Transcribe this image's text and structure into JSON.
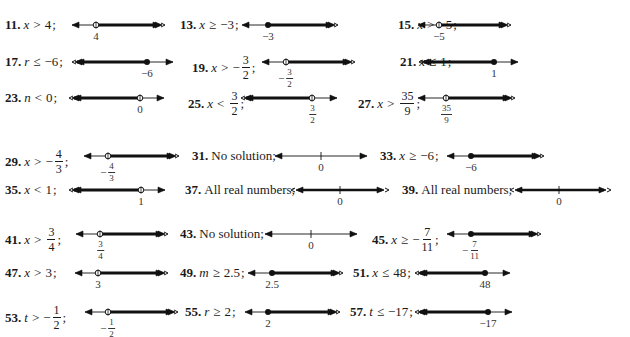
{
  "answers": [
    {
      "id": "11",
      "num": "11.",
      "var": "x",
      "rel": ">",
      "val": "4",
      "kind": "ineq",
      "x": 5,
      "y": 25,
      "line": {
        "x1": 72,
        "x2": 162,
        "point": 96,
        "closed": false,
        "dir": "right",
        "label": "4"
      }
    },
    {
      "id": "13",
      "num": "13.",
      "var": "x",
      "rel": "≥",
      "val": "−3",
      "kind": "ineq",
      "x": 180,
      "y": 25,
      "line": {
        "x1": 242,
        "x2": 335,
        "point": 268,
        "closed": true,
        "dir": "right",
        "label": "−3"
      }
    },
    {
      "id": "15",
      "num": "15.",
      "var": "x",
      "rel": ">",
      "val": "−5",
      "kind": "ineq",
      "x": 398,
      "y": 25,
      "line": {
        "x1": 418,
        "x2": 508,
        "point": 439,
        "closed": false,
        "dir": "right",
        "label": "−5"
      }
    },
    {
      "id": "17",
      "num": "17.",
      "var": "r",
      "rel": "≤",
      "val": "−6",
      "kind": "ineq",
      "x": 5,
      "y": 62,
      "line": {
        "x1": 75,
        "x2": 173,
        "point": 147,
        "closed": true,
        "dir": "left",
        "label": "−6"
      }
    },
    {
      "id": "19",
      "num": "19.",
      "var": "x",
      "rel": ">",
      "val_sign": "−",
      "val_num": "3",
      "val_den": "2",
      "kind": "frac",
      "x": 192,
      "y": 62,
      "line": {
        "x1": 262,
        "x2": 352,
        "point": 286,
        "closed": false,
        "dir": "right",
        "label_sign": "−",
        "label_num": "3",
        "label_den": "2"
      }
    },
    {
      "id": "21",
      "num": "21.",
      "var": "x",
      "rel": "≤",
      "val": "1",
      "kind": "ineq",
      "x": 400,
      "y": 62,
      "line": {
        "x1": 422,
        "x2": 518,
        "point": 494,
        "closed": true,
        "dir": "left",
        "label": "1"
      }
    },
    {
      "id": "23",
      "num": "23.",
      "var": "n",
      "rel": "<",
      "val": "0",
      "kind": "ineq",
      "x": 5,
      "y": 98,
      "line": {
        "x1": 72,
        "x2": 164,
        "point": 140,
        "closed": false,
        "dir": "left",
        "label": "0"
      }
    },
    {
      "id": "25",
      "num": "25.",
      "var": "x",
      "rel": "<",
      "val_sign": "",
      "val_num": "3",
      "val_den": "2",
      "kind": "frac",
      "x": 188,
      "y": 98,
      "line": {
        "x1": 244,
        "x2": 337,
        "point": 312,
        "closed": false,
        "dir": "left",
        "label_sign": "",
        "label_num": "3",
        "label_den": "2"
      }
    },
    {
      "id": "27",
      "num": "27.",
      "var": "x",
      "rel": ">",
      "val_sign": "",
      "val_num": "35",
      "val_den": "9",
      "kind": "frac",
      "x": 358,
      "y": 98,
      "line": {
        "x1": 418,
        "x2": 512,
        "point": 446,
        "closed": false,
        "dir": "right",
        "label_sign": "",
        "label_num": "35",
        "label_den": "9"
      }
    },
    {
      "id": "29",
      "num": "29.",
      "var": "x",
      "rel": ">",
      "val_sign": "−",
      "val_num": "4",
      "val_den": "3",
      "kind": "frac",
      "x": 5,
      "y": 156,
      "line": {
        "x1": 84,
        "x2": 176,
        "point": 108,
        "closed": false,
        "dir": "right",
        "label_sign": "−",
        "label_num": "4",
        "label_den": "3"
      }
    },
    {
      "id": "31",
      "num": "31.",
      "text": "No solution;",
      "kind": "text",
      "x": 192,
      "y": 156,
      "line": {
        "x1": 275,
        "x2": 367,
        "tick": 321,
        "dir": "none",
        "label": "0"
      }
    },
    {
      "id": "33",
      "num": "33.",
      "var": "x",
      "rel": "≥",
      "val": "−6",
      "kind": "ineq",
      "x": 380,
      "y": 156,
      "line": {
        "x1": 447,
        "x2": 541,
        "point": 471,
        "closed": true,
        "dir": "right",
        "label": "−6"
      }
    },
    {
      "id": "35",
      "num": "35.",
      "var": "x",
      "rel": "<",
      "val": "1",
      "kind": "ineq",
      "x": 5,
      "y": 190,
      "line": {
        "x1": 72,
        "x2": 165,
        "point": 141,
        "closed": false,
        "dir": "left",
        "label": "1"
      }
    },
    {
      "id": "37",
      "num": "37.",
      "text": "All real numbers;",
      "kind": "text",
      "x": 185,
      "y": 190,
      "line": {
        "x1": 296,
        "x2": 384,
        "tick": 340,
        "dir": "both",
        "label": "0"
      }
    },
    {
      "id": "39",
      "num": "39.",
      "text": "All real numbers;",
      "kind": "text",
      "x": 402,
      "y": 190,
      "line": {
        "x1": 515,
        "x2": 606,
        "tick": 559,
        "dir": "both",
        "label": "0"
      }
    },
    {
      "id": "41",
      "num": "41.",
      "var": "x",
      "rel": ">",
      "val_sign": "",
      "val_num": "3",
      "val_den": "4",
      "kind": "frac",
      "x": 5,
      "y": 234,
      "line": {
        "x1": 76,
        "x2": 165,
        "point": 100,
        "closed": false,
        "dir": "right",
        "label_sign": "",
        "label_num": "3",
        "label_den": "4"
      }
    },
    {
      "id": "43",
      "num": "43.",
      "text": "No solution;",
      "kind": "text",
      "x": 180,
      "y": 234,
      "line": {
        "x1": 265,
        "x2": 357,
        "tick": 311,
        "dir": "none",
        "label": "0"
      }
    },
    {
      "id": "45",
      "num": "45.",
      "var": "x",
      "rel": "≥",
      "val_sign": "−",
      "val_num": "7",
      "val_den": "11",
      "kind": "frac",
      "x": 372,
      "y": 234,
      "line": {
        "x1": 447,
        "x2": 538,
        "point": 471,
        "closed": true,
        "dir": "right",
        "label_sign": "−",
        "label_num": "7",
        "label_den": "11"
      }
    },
    {
      "id": "47",
      "num": "47.",
      "var": "x",
      "rel": ">",
      "val": "3",
      "kind": "ineq",
      "x": 5,
      "y": 273,
      "line": {
        "x1": 75,
        "x2": 165,
        "point": 98,
        "closed": false,
        "dir": "right",
        "label": "3"
      }
    },
    {
      "id": "49",
      "num": "49.",
      "var": "m",
      "rel": "≥",
      "val": "2.5",
      "kind": "ineq",
      "x": 180,
      "y": 273,
      "line": {
        "x1": 248,
        "x2": 340,
        "point": 272,
        "closed": true,
        "dir": "right",
        "label": "2.5"
      }
    },
    {
      "id": "51",
      "num": "51.",
      "var": "x",
      "rel": "≤",
      "val": "48",
      "kind": "ineq",
      "x": 353,
      "y": 273,
      "line": {
        "x1": 418,
        "x2": 510,
        "point": 485,
        "closed": true,
        "dir": "left",
        "label": "48"
      }
    },
    {
      "id": "53",
      "num": "53.",
      "var": "t",
      "rel": ">",
      "val_sign": "−",
      "val_num": "1",
      "val_den": "2",
      "kind": "frac",
      "x": 5,
      "y": 312,
      "line": {
        "x1": 85,
        "x2": 175,
        "point": 108,
        "closed": false,
        "dir": "right",
        "label_sign": "−",
        "label_num": "1",
        "label_den": "2"
      }
    },
    {
      "id": "55",
      "num": "55.",
      "var": "r",
      "rel": "≥",
      "val": "2",
      "kind": "ineq",
      "x": 185,
      "y": 312,
      "line": {
        "x1": 245,
        "x2": 337,
        "point": 268,
        "closed": true,
        "dir": "right",
        "label": "2"
      }
    },
    {
      "id": "57",
      "num": "57.",
      "var": "t",
      "rel": "≤",
      "val": "−17",
      "kind": "ineq",
      "x": 350,
      "y": 312,
      "line": {
        "x1": 418,
        "x2": 512,
        "point": 488,
        "closed": true,
        "dir": "left",
        "label": "−17"
      }
    }
  ]
}
